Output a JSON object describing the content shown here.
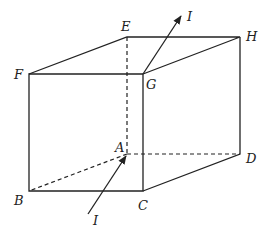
{
  "diagram": {
    "type": "cuboid-with-current",
    "vertices": {
      "A": {
        "label": "A",
        "x": 127,
        "y": 154
      },
      "B": {
        "label": "B",
        "x": 29,
        "y": 191
      },
      "C": {
        "label": "C",
        "x": 143,
        "y": 191
      },
      "D": {
        "label": "D",
        "x": 240,
        "y": 154
      },
      "E": {
        "label": "E",
        "x": 127,
        "y": 37
      },
      "F": {
        "label": "F",
        "x": 29,
        "y": 74
      },
      "G": {
        "label": "G",
        "x": 143,
        "y": 74
      },
      "H": {
        "label": "H",
        "x": 240,
        "y": 37
      }
    },
    "visible_edges": [
      "FG",
      "GH",
      "EH",
      "FE",
      "FB",
      "GC",
      "HD",
      "BC",
      "CD"
    ],
    "hidden_edges": [
      "AE",
      "AB",
      "AD"
    ],
    "currents": [
      {
        "label": "I",
        "from": "G",
        "direction": "outward-up",
        "end_x": 181,
        "end_y": 16
      },
      {
        "label": "I",
        "to": "A",
        "direction": "inward",
        "start_x": 88,
        "start_y": 214
      }
    ],
    "current_label": "I",
    "line_color": "#222222"
  }
}
